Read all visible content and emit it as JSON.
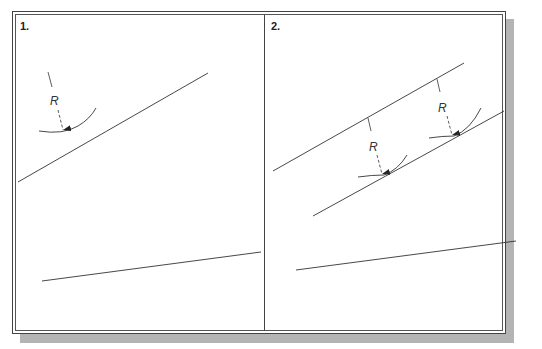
{
  "figure": {
    "panels": [
      {
        "label": "1.",
        "dimension_labels": [
          "R"
        ],
        "description": "Arc of radius R and an inclined line, before constructing the tangent arc"
      },
      {
        "label": "2.",
        "dimension_labels": [
          "R",
          "R"
        ],
        "description": "Parallel offset line at distance R used to locate arc centers"
      }
    ],
    "colors": {
      "line": "#333333",
      "frame": "#444444",
      "shadow": "#b4b4b4",
      "background": "#ffffff"
    }
  }
}
